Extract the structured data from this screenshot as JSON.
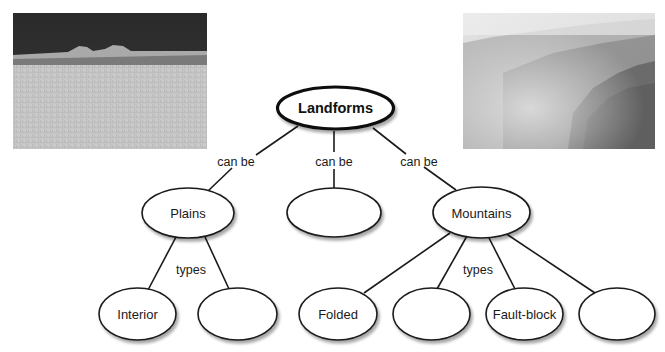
{
  "photos": {
    "plains": {
      "label": "plains-photo"
    },
    "mountains": {
      "label": "mountains-photo"
    }
  },
  "colors": {
    "stroke": "#1a1a1a",
    "fill": "#ffffff",
    "shadow": "#c8c8c8"
  },
  "diagram": {
    "root": {
      "label": "Landforms"
    },
    "link_labels": {
      "can_be_left": "can be",
      "can_be_center": "can be",
      "can_be_right": "can be",
      "types_plains": "types",
      "types_mountains": "types"
    },
    "level1": [
      {
        "label": "Plains"
      },
      {
        "label": ""
      },
      {
        "label": "Mountains"
      }
    ],
    "level2": [
      {
        "label": "Interior"
      },
      {
        "label": ""
      },
      {
        "label": "Folded"
      },
      {
        "label": ""
      },
      {
        "label": "Fault-block"
      },
      {
        "label": ""
      }
    ]
  }
}
